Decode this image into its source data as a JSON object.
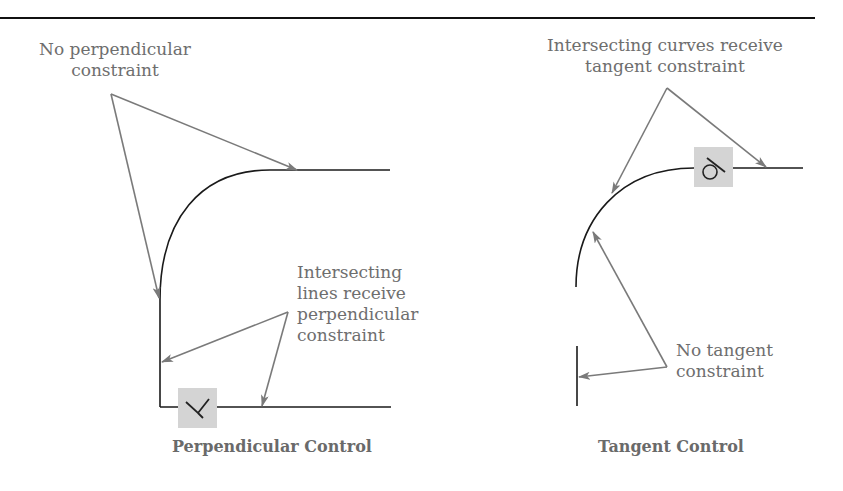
{
  "figure": {
    "top_rule": true,
    "left_panel": {
      "caption": "Perpendicular Control",
      "callouts": [
        {
          "id": "no-perp",
          "lines": [
            "No perpendicular",
            "constraint"
          ]
        },
        {
          "id": "perp",
          "lines": [
            "Intersecting",
            "lines receive",
            "perpendicular",
            "constraint"
          ]
        }
      ],
      "constraint_glyph": "perpendicular-icon"
    },
    "right_panel": {
      "caption": "Tangent Control",
      "callouts": [
        {
          "id": "tangent",
          "lines": [
            "Intersecting curves receive",
            "tangent constraint"
          ]
        },
        {
          "id": "no-tangent",
          "lines": [
            "No tangent",
            "constraint"
          ]
        }
      ],
      "constraint_glyph": "tangent-icon"
    },
    "colors": {
      "geometry": "#1a1a1a",
      "leader": "#7a7a7a",
      "text": "#6e6e6e",
      "glyph_box": "#d4d4d4"
    }
  }
}
